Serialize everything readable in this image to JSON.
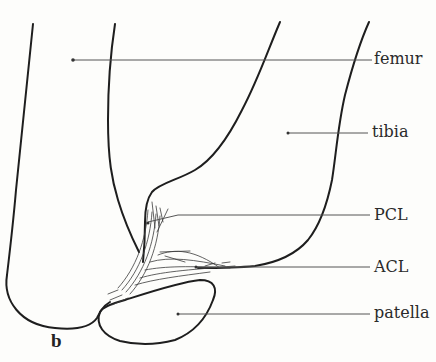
{
  "figure": {
    "panel_letter": "b",
    "labels": {
      "femur": "femur",
      "tibia": "tibia",
      "pcl": "PCL",
      "acl": "ACL",
      "patella": "patella"
    },
    "colors": {
      "outline": "#1e1e1e",
      "leader": "#555555",
      "fibers": "#3a3a3a",
      "background": "#fdfdfb"
    }
  }
}
